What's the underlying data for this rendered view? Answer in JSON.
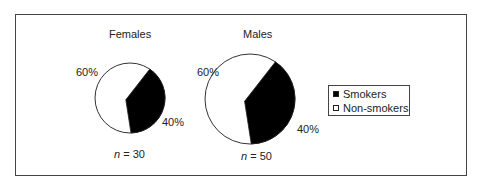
{
  "chart_data": {
    "type": "pie",
    "charts": [
      {
        "title": "Females",
        "n_label": "n",
        "n_value": "= 30",
        "n": 30,
        "slices": [
          {
            "label": "Smokers",
            "value": 40,
            "display": "40%",
            "color": "#000000"
          },
          {
            "label": "Non-smokers",
            "value": 60,
            "display": "60%",
            "color": "#ffffff"
          }
        ]
      },
      {
        "title": "Males",
        "n_label": "n",
        "n_value": "= 50",
        "n": 50,
        "slices": [
          {
            "label": "Smokers",
            "value": 40,
            "display": "40%",
            "color": "#000000"
          },
          {
            "label": "Non-smokers",
            "value": 60,
            "display": "60%",
            "color": "#ffffff"
          }
        ]
      }
    ],
    "legend": {
      "position": "right",
      "entries": [
        {
          "label": "Smokers",
          "color": "#000000"
        },
        {
          "label": "Non-smokers",
          "color": "#ffffff"
        }
      ]
    }
  }
}
